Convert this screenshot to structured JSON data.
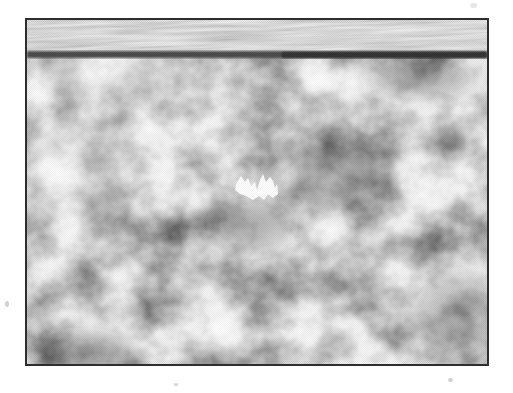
{
  "figure": {
    "page_background": "#ffffff",
    "frame_border_color": "#2e2e2e",
    "band_divider_color": "#4d4d4d",
    "band_divider_dark_color": "#343434",
    "band_tones": {
      "light": "#f0f0f0",
      "mid": "#b5b5b5",
      "dark": "#757575"
    },
    "granulation_tones": {
      "lane": "#fbfbfb",
      "cell": "#949494",
      "dark_spot": "#262626"
    },
    "marker_color": "#ffffff",
    "speck_color": "#c6c6c6"
  }
}
